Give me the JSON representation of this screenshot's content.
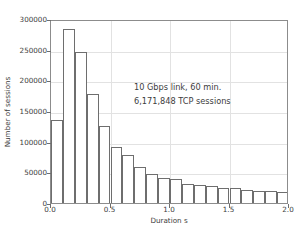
{
  "chart_data": {
    "type": "bar",
    "title": "",
    "xlabel": "Duration s",
    "ylabel": "Number of sessions",
    "xlim": [
      0.0,
      2.0
    ],
    "ylim": [
      0,
      300000
    ],
    "bin_width": 0.1,
    "grid": true,
    "legend": null,
    "xticks": [
      "0.0",
      "0.5",
      "1.0",
      "1.5",
      "2.0"
    ],
    "xtick_values": [
      0.0,
      0.5,
      1.0,
      1.5,
      2.0
    ],
    "yticks": [
      "0",
      "50000",
      "100000",
      "150000",
      "200000",
      "250000",
      "300000"
    ],
    "ytick_values": [
      0,
      50000,
      100000,
      150000,
      200000,
      250000,
      300000
    ],
    "bin_starts": [
      0.0,
      0.1,
      0.2,
      0.3,
      0.4,
      0.5,
      0.6,
      0.7,
      0.8,
      0.9,
      1.0,
      1.1,
      1.2,
      1.3,
      1.4,
      1.5,
      1.6,
      1.7,
      1.8,
      1.9
    ],
    "categories": [
      "0.0-0.1",
      "0.1-0.2",
      "0.2-0.3",
      "0.3-0.4",
      "0.4-0.5",
      "0.5-0.6",
      "0.6-0.7",
      "0.7-0.8",
      "0.8-0.9",
      "0.9-1.0",
      "1.0-1.1",
      "1.1-1.2",
      "1.2-1.3",
      "1.3-1.4",
      "1.4-1.5",
      "1.5-1.6",
      "1.6-1.7",
      "1.7-1.8",
      "1.8-1.9",
      "1.9-2.0"
    ],
    "values": [
      135000,
      283000,
      246000,
      177000,
      125000,
      92000,
      78000,
      58000,
      48000,
      40000,
      39000,
      31000,
      29000,
      27000,
      25000,
      24000,
      22000,
      20000,
      19000,
      18000
    ],
    "annotations": [
      "10 Gbps link, 60 min.",
      "6,171,848 TCP sessions"
    ],
    "colors": {
      "bar_fill": "#ffffff",
      "bar_edge": "#6e6e6e",
      "grid": "#e2e2e2",
      "frame": "#8c8c8c",
      "text": "#3d3d3d",
      "background": "#ffffff"
    }
  }
}
